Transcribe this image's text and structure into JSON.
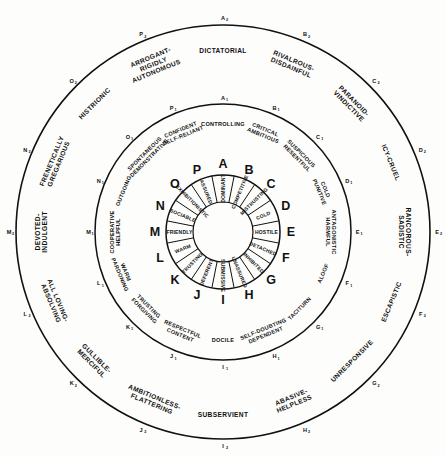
{
  "figure": {
    "ink_color": "#111111",
    "background_color": "#fdfdfb",
    "center": {
      "x": 223,
      "y": 232
    },
    "ring_radii": {
      "core_inner": 30,
      "core_outer": 57,
      "letter_band": 68,
      "ring2_inner": 80,
      "ring2_outer": 128,
      "ring3_inner": 137,
      "ring3_outer": 207
    }
  },
  "core_ring": {
    "description": "Innermost wheel: 16 single-letter sectors A-P with one-word trait",
    "segments": [
      {
        "letter": "A",
        "trait": "DOMINANT",
        "angle": -90
      },
      {
        "letter": "B",
        "trait": "COMPETITIVE",
        "angle": -67.5
      },
      {
        "letter": "C",
        "trait": "MISTRUSTING",
        "angle": -45
      },
      {
        "letter": "D",
        "trait": "COLD",
        "angle": -22.5
      },
      {
        "letter": "E",
        "trait": "HOSTILE",
        "angle": 0
      },
      {
        "letter": "F",
        "trait": "DETACHED",
        "angle": 22.5
      },
      {
        "letter": "G",
        "trait": "INHIBITED",
        "angle": 45
      },
      {
        "letter": "H",
        "trait": "UNASSURED",
        "angle": 67.5
      },
      {
        "letter": "I",
        "trait": "SUBMISSIVE",
        "angle": 90
      },
      {
        "letter": "J",
        "trait": "DEFERENT",
        "angle": 112.5
      },
      {
        "letter": "K",
        "trait": "TRUSTING",
        "angle": 135
      },
      {
        "letter": "L",
        "trait": "WARM",
        "angle": 157.5
      },
      {
        "letter": "M",
        "trait": "FRIENDLY",
        "angle": 180
      },
      {
        "letter": "N",
        "trait": "SOCIABLE",
        "angle": 202.5
      },
      {
        "letter": "O",
        "trait": "EXHIBITIONISTIC",
        "angle": 225
      },
      {
        "letter": "P",
        "trait": "ASSURED",
        "angle": 247.5
      }
    ]
  },
  "middle_ring": {
    "description": "Second ring: 16 moderate-intensity descriptors with subscript-1 codes",
    "segments": [
      {
        "code": "A",
        "sub": "1",
        "label": "CONTROLLING",
        "angle": -90
      },
      {
        "code": "B",
        "sub": "1",
        "label": "CRITICAL\nAMBITIOUS",
        "angle": -67.5
      },
      {
        "code": "C",
        "sub": "1",
        "label": "SUSPICIOUS\nRESENTFUL",
        "angle": -45
      },
      {
        "code": "D",
        "sub": "1",
        "label": "COLD\nPUNITIVE",
        "angle": -22.5
      },
      {
        "code": "E",
        "sub": "1",
        "label": "ANTAGONISTIC\nHARMFUL",
        "angle": 0
      },
      {
        "code": "F",
        "sub": "1",
        "label": "ALOOF",
        "angle": 22.5
      },
      {
        "code": "G",
        "sub": "1",
        "label": "TACITURN",
        "angle": 45
      },
      {
        "code": "H",
        "sub": "1",
        "label": "SELF-DOUBTING\nDEPENDENT",
        "angle": 67.5
      },
      {
        "code": "I",
        "sub": "1",
        "label": "DOCILE",
        "angle": 90
      },
      {
        "code": "J",
        "sub": "1",
        "label": "RESPECTFUL\nCONTENT",
        "angle": 112.5
      },
      {
        "code": "K",
        "sub": "1",
        "label": "TRUSTING\nFORGIVING",
        "angle": 135
      },
      {
        "code": "L",
        "sub": "1",
        "label": "WARM\nPARDONING",
        "angle": 157.5
      },
      {
        "code": "M",
        "sub": "1",
        "label": "COOPERATIVE\nHELPFUL",
        "angle": 180
      },
      {
        "code": "N",
        "sub": "1",
        "label": "OUTGOING",
        "angle": 202.5
      },
      {
        "code": "O",
        "sub": "1",
        "label": "SPONTANEOUS\nDEMONSTRATIVE",
        "angle": 225
      },
      {
        "code": "P",
        "sub": "1",
        "label": "CONFIDENT\nSELF-RELIANT",
        "angle": 247.5
      }
    ]
  },
  "outer_ring": {
    "description": "Outermost ring: 16 extreme-intensity descriptors with subscript-2 codes",
    "segments": [
      {
        "code": "A",
        "sub": "2",
        "label": "DICTATORIAL",
        "angle": -90
      },
      {
        "code": "B",
        "sub": "2",
        "label": "RIVALROUS-\nDISDAINFUL",
        "angle": -67.5
      },
      {
        "code": "C",
        "sub": "2",
        "label": "PARANOID-\nVINDICTIVE",
        "angle": -45
      },
      {
        "code": "D",
        "sub": "2",
        "label": "ICY-CRUEL",
        "angle": -22.5
      },
      {
        "code": "E",
        "sub": "2",
        "label": "RANCOROUS-\nSADISTIC",
        "angle": 0
      },
      {
        "code": "F",
        "sub": "2",
        "label": "ESCAPISTIC",
        "angle": 22.5
      },
      {
        "code": "G",
        "sub": "2",
        "label": "UNRESPONSIVE",
        "angle": 45
      },
      {
        "code": "H",
        "sub": "2",
        "label": "ABASIVE-\nHELPLESS",
        "angle": 67.5
      },
      {
        "code": "I",
        "sub": "2",
        "label": "SUBSERVIENT",
        "angle": 90
      },
      {
        "code": "J",
        "sub": "2",
        "label": "AMBITIONLESS-\nFLATTERING",
        "angle": 112.5
      },
      {
        "code": "K",
        "sub": "2",
        "label": "GULLIBLE-\nMERCIFUL",
        "angle": 135
      },
      {
        "code": "L",
        "sub": "2",
        "label": "ALL LOVING-\nABSOLVING",
        "angle": 157.5
      },
      {
        "code": "M",
        "sub": "2",
        "label": "DEVOTED-\nINDULGENT",
        "angle": 180
      },
      {
        "code": "N",
        "sub": "2",
        "label": "FRENETICALLY\nGREGARIOUS",
        "angle": 202.5
      },
      {
        "code": "O",
        "sub": "2",
        "label": "HISTRIONIC",
        "angle": 225
      },
      {
        "code": "P",
        "sub": "2",
        "label": "ARROGANT-\nRIGIDLY\nAUTONOMOUS",
        "angle": 247.5
      }
    ]
  }
}
